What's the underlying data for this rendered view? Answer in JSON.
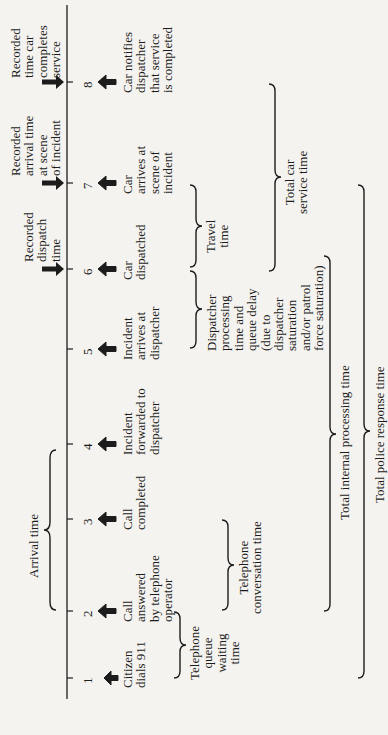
{
  "diagram": {
    "orientation": "rotated-90-ccw",
    "axis": {
      "ticks": [
        "1",
        "2",
        "3",
        "4",
        "5",
        "6",
        "7",
        "8"
      ]
    },
    "events": [
      {
        "num": "1",
        "label": "Citizen\ndials 911"
      },
      {
        "num": "2",
        "label": "Call\nanswered\nby telephone\noperator"
      },
      {
        "num": "3",
        "label": "Call\ncompleted"
      },
      {
        "num": "4",
        "label": "Incident\nforwarded to\ndispatcher"
      },
      {
        "num": "5",
        "label": "Incident\narrives at\ndispatcher"
      },
      {
        "num": "6",
        "label": "Car\ndispatched"
      },
      {
        "num": "7",
        "label": "Car\narrives at\nscene of\nincident"
      },
      {
        "num": "8",
        "label": "Car notifies\ndispatcher\nthat service\nis completed"
      }
    ],
    "recorded": [
      {
        "at": "6",
        "label": "Recorded\ndispatch\ntime"
      },
      {
        "at": "7",
        "label": "Recorded\narrival time\nat scene\nof incident"
      },
      {
        "at": "8",
        "label": "Recorded\ntime car\ncompletes\nservice"
      }
    ],
    "intervals": {
      "arrival_time": {
        "from": "2",
        "to": "4",
        "label": "Arrival time"
      },
      "telephone_queue": {
        "from": "1",
        "to": "2",
        "label": "Telephone\nqueue\nwaiting\ntime"
      },
      "telephone_conversation": {
        "from": "2",
        "to": "3",
        "label": "Telephone\nconversation time"
      },
      "dispatcher_processing": {
        "from": "5",
        "to": "6",
        "label": "Dispatcher\nprocessing\ntime and\nqueue delay\n(due to\ndispatcher\nsaturation\nand/or patrol\nforce saturation)"
      },
      "travel_time": {
        "from": "6",
        "to": "7",
        "label": "Travel\ntime"
      },
      "total_car_service": {
        "from": "6",
        "to": "8",
        "label": "Total car\nservice time"
      },
      "total_internal_processing": {
        "from": "2",
        "to": "6",
        "label": "Total internal processing time"
      },
      "total_police_response": {
        "from": "1",
        "to": "7",
        "label": "Total police response time"
      }
    }
  }
}
